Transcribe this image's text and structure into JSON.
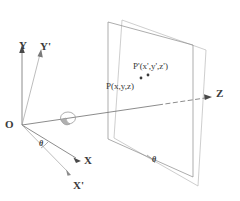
{
  "figure": {
    "stroke_color": "#6e6e6e",
    "label_color": "#3a3a3a",
    "background_color": "#ffffff"
  },
  "axes": {
    "origin_label": "O",
    "y_label": "Y",
    "y_prime_label": "Y'",
    "x_label": "X",
    "x_prime_label": "X'",
    "z_label": "Z"
  },
  "points": {
    "p_label": "P(x,y,z)",
    "p_prime_label": "P'(x',y',z')"
  },
  "angles": {
    "theta_xy_label": "θ",
    "theta_plane_label": "θ"
  }
}
